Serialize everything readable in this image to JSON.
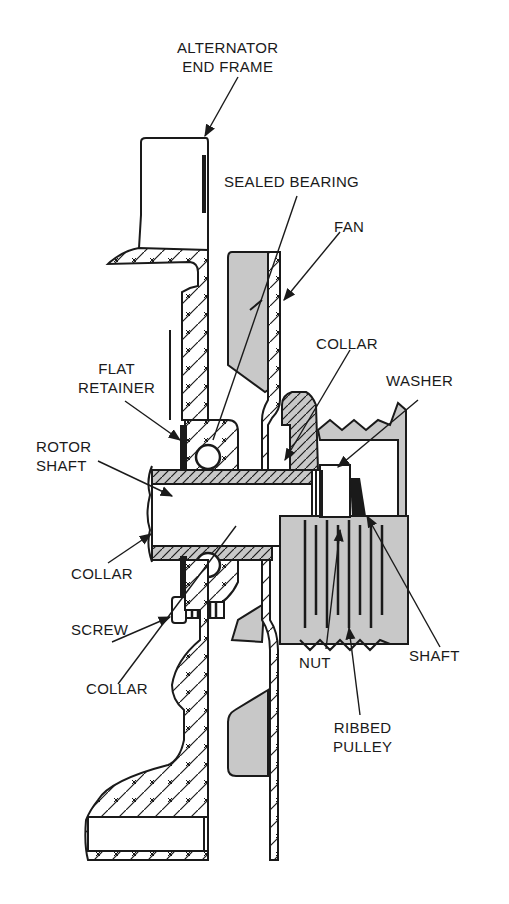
{
  "diagram": {
    "colors": {
      "background": "#ffffff",
      "line": "#1a1a1a",
      "shade": "#c8c8c8"
    },
    "labels": {
      "alternator_end_frame": "ALTERNATOR\nEND FRAME",
      "sealed_bearing": "SEALED BEARING",
      "fan": "FAN",
      "collar_top": "COLLAR",
      "washer": "WASHER",
      "flat_retainer": "FLAT\nRETAINER",
      "rotor_shaft": "ROTOR\nSHAFT",
      "collar_left": "COLLAR",
      "screw": "SCREW",
      "collar_bottom": "COLLAR",
      "nut": "NUT",
      "shaft": "SHAFT",
      "ribbed_pulley": "RIBBED\nPULLEY"
    }
  }
}
